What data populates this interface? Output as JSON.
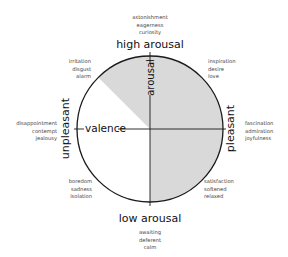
{
  "diagram": {
    "poles": {
      "top": "high arousal",
      "bottom": "low arousal",
      "left": "unpleasant",
      "right": "pleasant"
    },
    "axes": {
      "vertical": "arousal",
      "horizontal": "valence"
    },
    "emotions": {
      "top": [
        "astonishment",
        "eagerness",
        "curiosity"
      ],
      "top_left": [
        "irritation",
        "disgust",
        "alarm"
      ],
      "top_right": [
        "inspiration",
        "desire",
        "love"
      ],
      "left": [
        "disappointment",
        "contempt",
        "jealousy"
      ],
      "right": [
        "fascination",
        "admiration",
        "joyfulness"
      ],
      "bottom_left": [
        "boredom",
        "sadness",
        "isolation"
      ],
      "bottom_right": [
        "satisfaction",
        "softened",
        "relaxed"
      ],
      "bottom": [
        "awaiting",
        "deferent",
        "calm"
      ]
    },
    "colors": {
      "shade": "#d9d9d9",
      "stroke": "#1a1a1a"
    }
  }
}
